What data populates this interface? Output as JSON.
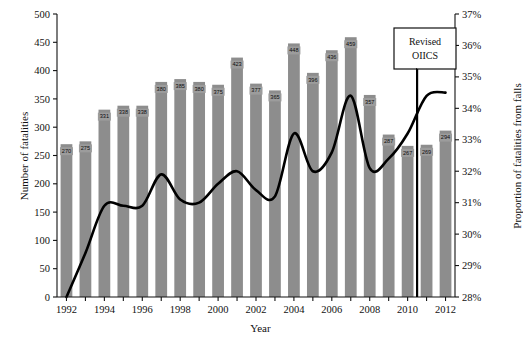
{
  "chart_data": {
    "type": "bar",
    "title": "",
    "xlabel": "Year",
    "ylabel": "Number of fatalities",
    "ylabel_right": "Proportion of fatalities from falls",
    "categories": [
      1992,
      1993,
      1994,
      1995,
      1996,
      1997,
      1998,
      1999,
      2000,
      2001,
      2002,
      2003,
      2004,
      2005,
      2006,
      2007,
      2008,
      2009,
      2010,
      2011,
      2012
    ],
    "ylim": [
      0,
      500
    ],
    "yticks": [
      0,
      50,
      100,
      150,
      200,
      250,
      300,
      350,
      400,
      450,
      500
    ],
    "ylim_right": [
      28,
      37
    ],
    "yticks_right": [
      "28%",
      "29%",
      "30%",
      "31%",
      "32%",
      "33%",
      "34%",
      "35%",
      "36%",
      "37%"
    ],
    "xticks": [
      1992,
      1994,
      1996,
      1998,
      2000,
      2002,
      2004,
      2006,
      2008,
      2010,
      2012
    ],
    "grid": false,
    "legend": "none",
    "series": [
      {
        "name": "Number of fatalities",
        "type": "bar",
        "color": "#8d8d8d",
        "values": [
          270,
          275,
          331,
          338,
          338,
          380,
          385,
          380,
          375,
          423,
          377,
          365,
          448,
          396,
          436,
          459,
          357,
          287,
          267,
          269,
          294
        ],
        "labels": [
          "270",
          "275",
          "331",
          "338",
          "338",
          "380",
          "385",
          "380",
          "375",
          "423",
          "377",
          "365",
          "448",
          "396",
          "436",
          "459",
          "357",
          "287",
          "267",
          "269",
          "294"
        ]
      },
      {
        "name": "Proportion of fatalities from falls",
        "type": "line",
        "color": "#000000",
        "axis": "right",
        "values": [
          28.0,
          29.4,
          30.9,
          30.9,
          30.9,
          31.9,
          31.1,
          31.0,
          31.6,
          32.0,
          31.4,
          31.2,
          33.2,
          32.0,
          32.6,
          34.4,
          32.1,
          32.4,
          33.2,
          34.4,
          34.5
        ]
      }
    ],
    "annotations": [
      {
        "name": "revised-oiics-callout",
        "line1": "Revised",
        "line2": "OIICS",
        "target_year": 2011
      }
    ]
  }
}
